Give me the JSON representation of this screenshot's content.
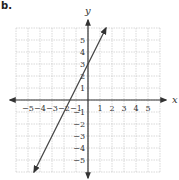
{
  "problem_label": "b.",
  "chart_data": {
    "type": "line",
    "title": "",
    "xlabel": "x",
    "ylabel": "y",
    "xlim": [
      -6,
      6
    ],
    "ylim": [
      -6,
      6
    ],
    "grid": true,
    "x_tick_labels": [
      "−5",
      "−4",
      "−3",
      "−2",
      "−1",
      "1",
      "2",
      "3",
      "4",
      "5"
    ],
    "y_tick_labels": [
      "5",
      "4",
      "3",
      "2",
      "1",
      "−1",
      "−2",
      "−3",
      "−4",
      "−5"
    ],
    "series": [
      {
        "name": "line",
        "equation": "y = 2x + 3",
        "slope": 2,
        "intercept": 3,
        "x": [
          -4.5,
          1.5
        ],
        "y": [
          -6,
          6
        ],
        "arrows": "both"
      }
    ]
  },
  "colors": {
    "grid": "#c8c8c8",
    "axis": "#333333",
    "line": "#444444"
  }
}
